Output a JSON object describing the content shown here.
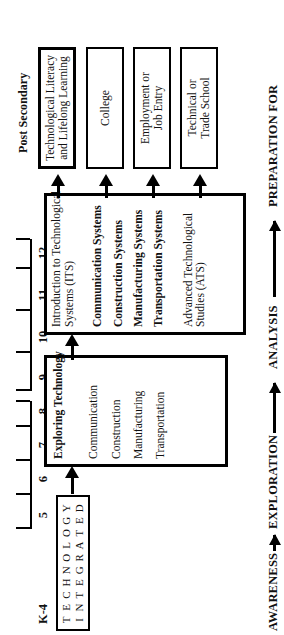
{
  "diagram": {
    "orientation": "rotated-90-ccw",
    "post_secondary": {
      "heading": "Post Secondary",
      "boxes": [
        {
          "id": "tech-literacy",
          "label_line1": "Technological Literacy",
          "label_line2": "and Lifelong Learning"
        },
        {
          "id": "college",
          "label_line1": "College",
          "label_line2": ""
        },
        {
          "id": "employment",
          "label_line1": "Employment or",
          "label_line2": "Job Entry"
        },
        {
          "id": "trade-school",
          "label_line1": "Technical or",
          "label_line2": "Trade School"
        }
      ]
    },
    "high_school": {
      "grades": [
        "9",
        "10",
        "11",
        "12"
      ],
      "courses": [
        {
          "text_line1": "Introduction to Technological",
          "text_line2": "Systems (ITS)",
          "bold": false
        },
        {
          "text_line1": "Communication Systems",
          "text_line2": "",
          "bold": true
        },
        {
          "text_line1": "Construction Systems",
          "text_line2": "",
          "bold": true
        },
        {
          "text_line1": "Manufacturing Systems",
          "text_line2": "",
          "bold": true
        },
        {
          "text_line1": "Transportation Systems",
          "text_line2": "",
          "bold": true
        },
        {
          "text_line1": "Advanced Technological",
          "text_line2": "Studies (ATS)",
          "bold": false
        }
      ]
    },
    "middle_school": {
      "grades": [
        "5",
        "6",
        "7",
        "8"
      ],
      "courses": [
        {
          "text_line1": "Exploring Technology",
          "text_line2": "",
          "bold": true
        },
        {
          "text_line1": "Communication",
          "text_line2": "",
          "bold": false
        },
        {
          "text_line1": "Construction",
          "text_line2": "",
          "bold": false
        },
        {
          "text_line1": "Manufacturing",
          "text_line2": "",
          "bold": false
        },
        {
          "text_line1": "Transportation",
          "text_line2": "",
          "bold": false
        }
      ]
    },
    "elementary": {
      "grade_label": "K-4",
      "grid_row_top": [
        "T",
        "E",
        "C",
        "H",
        "N",
        "O",
        "L",
        "O",
        "G",
        "Y"
      ],
      "grid_row_bottom": [
        "I",
        "N",
        "T",
        "E",
        "G",
        "R",
        "A",
        "T",
        "E",
        "D"
      ],
      "grid_words": [
        "TECHNOLOGY",
        "INTEGRATED"
      ]
    },
    "grade_scale": {
      "labels": [
        "K-4",
        "5",
        "6",
        "7",
        "8",
        "9",
        "10",
        "11",
        "12"
      ]
    },
    "phases": [
      {
        "label": "AWARENESS"
      },
      {
        "label": "EXPLORATION"
      },
      {
        "label": "ANALYSIS"
      },
      {
        "label": "PREPARATION FOR"
      }
    ],
    "colors": {
      "ink": "#000000",
      "paper": "#ffffff"
    }
  }
}
